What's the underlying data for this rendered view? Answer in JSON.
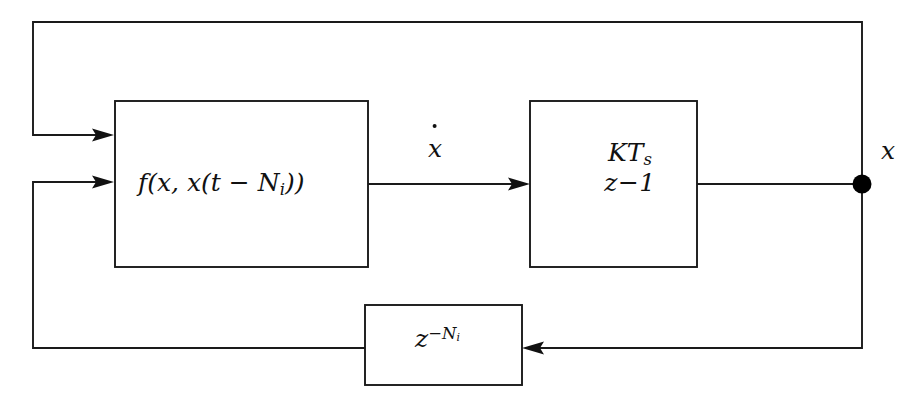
{
  "diagram": {
    "canvas": {
      "width": 918,
      "height": 410,
      "background": "#ffffff"
    },
    "line_color": "#1a1a1a",
    "blocks": [
      {
        "id": "nonlinear-function",
        "label_plain": "f(x, x(t - N_i))",
        "label_main": "f(x, x(t",
        "label_minus": " − ",
        "label_n": "N",
        "label_n_sub": "i",
        "label_tail": "))",
        "x": 115,
        "y": 101,
        "width": 253,
        "height": 166
      },
      {
        "id": "integrator",
        "label_plain": "KT_s / (z-1)",
        "numerator": "KT",
        "numerator_sub": "s",
        "denominator": "z−1",
        "x": 530,
        "y": 101,
        "width": 167,
        "height": 166
      },
      {
        "id": "delay",
        "label_plain": "z^{-N_i}",
        "base": "z",
        "exponent_sign": "−",
        "exponent_n": "N",
        "exponent_sub": "i",
        "x": 365,
        "y": 305,
        "width": 157,
        "height": 80
      }
    ],
    "signals": [
      {
        "id": "x-dot",
        "label": "x",
        "accent": "dot",
        "x": 428,
        "y": 136
      },
      {
        "id": "x-output",
        "label": "x",
        "accent": "none",
        "x": 881,
        "y": 138
      }
    ],
    "junction": {
      "id": "output-node",
      "cx": 862,
      "cy": 184,
      "r": 9.5,
      "color": "#000000"
    },
    "wires": [
      {
        "id": "f-to-integrator",
        "from": "nonlinear-function",
        "to": "integrator",
        "arrow": true
      },
      {
        "id": "integrator-to-node",
        "from": "integrator",
        "to": "output-node",
        "arrow": false
      },
      {
        "id": "node-to-outer-feedback",
        "from": "output-node",
        "to": "nonlinear-function-input-1",
        "arrow": true
      },
      {
        "id": "node-to-delay",
        "from": "output-node",
        "to": "delay",
        "arrow": true
      },
      {
        "id": "delay-to-f-input-2",
        "from": "delay",
        "to": "nonlinear-function-input-2",
        "arrow": true
      }
    ]
  }
}
